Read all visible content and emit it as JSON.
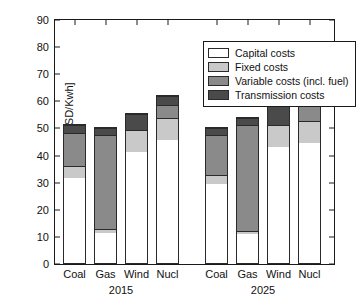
{
  "chart_data": {
    "type": "bar",
    "subtype": "stacked-grouped",
    "title": "",
    "xlabel": "",
    "ylabel": "Cost [millions USD/Kwh]",
    "ylim": [
      0,
      90
    ],
    "ytick_values": [
      0,
      10,
      20,
      30,
      40,
      50,
      60,
      70,
      80,
      90
    ],
    "ytick_labels": [
      "0",
      "10",
      "20",
      "30",
      "40",
      "50",
      "60",
      "70",
      "80",
      "90"
    ],
    "grid": false,
    "legend_position": "upper right",
    "groups": [
      "2015",
      "2025"
    ],
    "categories": [
      "Coal",
      "Gas",
      "Wind",
      "Nucl"
    ],
    "series": [
      {
        "name": "Capital costs",
        "color": "#ffffff",
        "values_2015": [
          31.8,
          11.4,
          41.5,
          45.9
        ],
        "values_2025": [
          29.4,
          11.0,
          43.3,
          44.9
        ]
      },
      {
        "name": "Fixed costs",
        "color": "#c9c9c9",
        "values_2015": [
          4.5,
          1.3,
          8.1,
          8.1
        ],
        "values_2025": [
          3.7,
          1.1,
          8.1,
          8.0
        ]
      },
      {
        "name": "Variable costs (incl. fuel)",
        "color": "#8a8a8a",
        "values_2015": [
          12.2,
          35.3,
          0.0,
          4.8
        ],
        "values_2025": [
          14.7,
          39.6,
          0.0,
          6.9
        ]
      },
      {
        "name": "Transmission costs",
        "color": "#4a4a4a",
        "values_2015": [
          3.3,
          2.7,
          6.2,
          3.7
        ],
        "values_2025": [
          2.9,
          2.6,
          7.2,
          2.6
        ]
      }
    ],
    "totals_2015": [
      51.8,
      50.7,
      55.8,
      62.5
    ],
    "totals_2025": [
      50.7,
      54.3,
      58.6,
      62.4
    ]
  },
  "legend": {
    "items": [
      {
        "label": "Capital costs"
      },
      {
        "label": "Fixed costs"
      },
      {
        "label": "Variable costs (incl. fuel)"
      },
      {
        "label": "Transmission costs"
      }
    ]
  }
}
